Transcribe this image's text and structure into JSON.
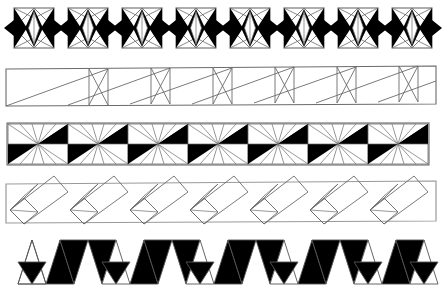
{
  "plate": {
    "title": "Decorative geometric border bands",
    "width": 442,
    "height": 291,
    "background_color": "#ffffff",
    "ink_color": "#000000",
    "line_color": "#6b6b6b",
    "band_count": 5
  },
  "bands": [
    {
      "id": "band-1",
      "name": "square-lozenge-rosette-band",
      "description": "Row of outlined squares each containing a white vertical lens flanked by black lobes, linked by outward-pointing black triangles",
      "repeat_count": 8,
      "unit_width": 52,
      "x_start": 14,
      "y_top": 6,
      "y_bottom": 50,
      "fill": "#000000",
      "outline": "#6b6b6b"
    },
    {
      "id": "band-2",
      "name": "rectangle-diagonal-truss-band",
      "description": "Long outlined strip divided into wide rectangles with a single rising diagonal alternating with narrow panels crossed by two diagonals",
      "repeat_count": 7,
      "unit_width": 58,
      "x_start": 6,
      "y_top": 68,
      "y_bottom": 106,
      "fill": "none",
      "outline": "#6b6b6b"
    },
    {
      "id": "band-3",
      "name": "radiating-fan-pinwheel-band",
      "description": "Strip of square cells each with rays radiating from the centre and solid black triangles at upper-right and lower-left",
      "repeat_count": 14,
      "unit_width": 30,
      "x_start": 8,
      "y_top": 124,
      "y_bottom": 162,
      "fill": "#000000",
      "outline": "#6b6b6b"
    },
    {
      "id": "band-4",
      "name": "tilted-rectangle-overlap-band",
      "description": "Long outlined strip containing a chain of overlapping slanted rectangles each anchored by a small tilted square at its lower-left",
      "repeat_count": 7,
      "unit_width": 60,
      "x_start": 6,
      "y_top": 182,
      "y_bottom": 222,
      "fill": "none",
      "outline": "#6b6b6b"
    },
    {
      "id": "band-5",
      "name": "alternating-triangle-zigzag-band",
      "description": "Zigzag strip of up and down pointing triangles, nearly all solid black with a few left in outline only",
      "repeat_count": 28,
      "unit_width": 14,
      "x_start": 18,
      "y_top": 240,
      "y_bottom": 286,
      "fill": "#000000",
      "outline": "#555555"
    }
  ]
}
